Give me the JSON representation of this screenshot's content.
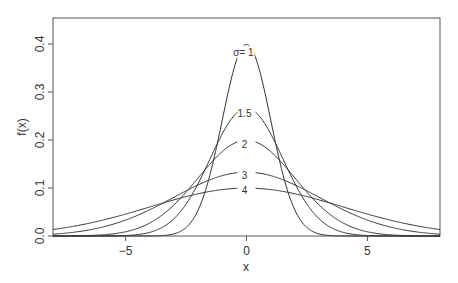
{
  "chart_data": {
    "type": "line",
    "title": "",
    "xlabel": "x",
    "ylabel": "f(x)",
    "xlim": [
      -8,
      8
    ],
    "ylim": [
      0,
      0.45
    ],
    "xticks": [
      -5,
      0,
      5
    ],
    "xtick_labels": [
      "−5",
      "0",
      "5"
    ],
    "yticks": [
      0.0,
      0.1,
      0.2,
      0.3,
      0.4
    ],
    "ytick_labels": [
      "0.0",
      "0.1",
      "0.2",
      "0.3",
      "0.4"
    ],
    "grid": false,
    "legend": "none (inline curve labels)",
    "series": [
      {
        "name": "σ= 1",
        "sigma": 1,
        "mean": 0,
        "peak": 0.399
      },
      {
        "name": "1.5",
        "sigma": 1.5,
        "mean": 0,
        "peak": 0.266
      },
      {
        "name": "2",
        "sigma": 2,
        "mean": 0,
        "peak": 0.199
      },
      {
        "name": "3",
        "sigma": 3,
        "mean": 0,
        "peak": 0.133
      },
      {
        "name": "4",
        "sigma": 4,
        "mean": 0,
        "peak": 0.0997
      }
    ]
  }
}
